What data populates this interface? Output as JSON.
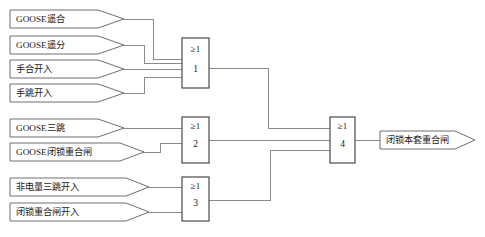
{
  "diagram": {
    "colors": {
      "wire": "#8a8a8a",
      "shape_outline": "#6f6f6f",
      "gate_outline": "#4a4a4a",
      "text": "#1a1a1a",
      "background": "#ffffff"
    },
    "inputs": [
      {
        "id": "in-goose-yaohe",
        "label": "GOOSE遥合",
        "x": 10,
        "y": 10,
        "w": 100,
        "h": 18,
        "group": 1
      },
      {
        "id": "in-goose-yaofen",
        "label": "GOOSE遥分",
        "x": 10,
        "y": 36,
        "w": 100,
        "h": 18,
        "group": 1
      },
      {
        "id": "in-shouhe-kairu",
        "label": "手合开入",
        "x": 10,
        "y": 60,
        "w": 100,
        "h": 18,
        "group": 1
      },
      {
        "id": "in-shoutiao-kairu",
        "label": "手跳开入",
        "x": 10,
        "y": 84,
        "w": 100,
        "h": 18,
        "group": 1
      },
      {
        "id": "in-goose-santiao",
        "label": "GOOSE三跳",
        "x": 10,
        "y": 119,
        "w": 100,
        "h": 18,
        "group": 2
      },
      {
        "id": "in-goose-bisuo-chonghe",
        "label": "GOOSE闭锁重合闸",
        "x": 10,
        "y": 143,
        "w": 120,
        "h": 18,
        "group": 2
      },
      {
        "id": "in-feidianliang",
        "label": "非电量三跳开入",
        "x": 10,
        "y": 178,
        "w": 125,
        "h": 18,
        "group": 3
      },
      {
        "id": "in-bisuo-chonghe",
        "label": "闭锁重合闸开入",
        "x": 10,
        "y": 203,
        "w": 125,
        "h": 18,
        "group": 3
      }
    ],
    "gates": [
      {
        "id": "gate-1",
        "symbol": "≥1",
        "number": "1",
        "x": 182,
        "y": 38,
        "w": 27,
        "h": 50
      },
      {
        "id": "gate-2",
        "symbol": "≥1",
        "number": "2",
        "x": 182,
        "y": 117,
        "w": 27,
        "h": 46
      },
      {
        "id": "gate-3",
        "symbol": "≥1",
        "number": "3",
        "x": 182,
        "y": 177,
        "w": 27,
        "h": 44
      },
      {
        "id": "gate-4",
        "symbol": "≥1",
        "number": "4",
        "x": 330,
        "y": 117,
        "w": 25,
        "h": 46
      }
    ],
    "outputs": [
      {
        "id": "out-bisuo-ben-tao",
        "label": "闭锁本套重合闸",
        "x": 380,
        "y": 131,
        "w": 95,
        "h": 18
      }
    ],
    "gate_symbol_legend": "≥1 (OR gate)"
  }
}
